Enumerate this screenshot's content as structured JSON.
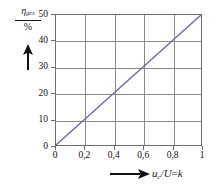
{
  "chart_data": {
    "type": "line",
    "title": "",
    "subtitle": "",
    "ylabel_numerator": "η",
    "ylabel_subscript": "ges",
    "ylabel_denominator": "%",
    "ylabel_full": "η_ges / %",
    "xlabel_symbol": "u",
    "xlabel_subscript": "c",
    "xlabel_rest": "/U",
    "xlabel_equals": "=",
    "xlabel_variable": "k",
    "xlabel_full": "u_c /U = k",
    "x": [
      0,
      1
    ],
    "values": [
      0,
      50
    ],
    "series": [
      {
        "name": "η_ges",
        "points": [
          {
            "x": 0,
            "y": 0
          },
          {
            "x": 0.2,
            "y": 10
          },
          {
            "x": 0.4,
            "y": 20
          },
          {
            "x": 0.6,
            "y": 30
          },
          {
            "x": 0.8,
            "y": 40
          },
          {
            "x": 1,
            "y": 50
          }
        ]
      }
    ],
    "xlim": [
      0,
      1
    ],
    "ylim": [
      0,
      50
    ],
    "xticks": [
      0,
      0.2,
      0.4,
      0.6,
      0.8,
      1
    ],
    "yticks": [
      0,
      10,
      20,
      30,
      40,
      50
    ],
    "xticklabels": [
      "0",
      "0,2",
      "0,4",
      "0,6",
      "0,8",
      "1"
    ],
    "yticklabels": [
      "0",
      "10",
      "20",
      "30",
      "40",
      "50"
    ],
    "grid": true,
    "legend": false,
    "legend_position": "none",
    "line_color": "#6b6ba6",
    "grid_color": "#8a8a8a",
    "frame_color": "#6e6e6e",
    "background_color": "#ffffff",
    "y_axis_arrow": "up-arrow",
    "x_axis_arrow": "right-arrow"
  }
}
